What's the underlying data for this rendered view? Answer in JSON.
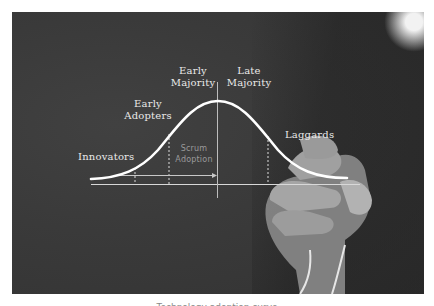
{
  "diagram": {
    "curve_type": "bell",
    "segments": [
      {
        "label": "Innovators"
      },
      {
        "label": "Early Adopters"
      },
      {
        "label": "Early Majority"
      },
      {
        "label": "Late Majority"
      },
      {
        "label": "Laggards"
      }
    ],
    "labels": {
      "innovators": "Innovators",
      "early_adopters_1": "Early",
      "early_adopters_2": "Adopters",
      "early_majority_1": "Early",
      "early_majority_2": "Majority",
      "late_majority_1": "Late",
      "late_majority_2": "Majority",
      "laggards": "Laggards",
      "scrum_1": "Scrum",
      "scrum_2": "Adoption"
    },
    "colors": {
      "background": "#3a3a3a",
      "curve": "#ffffff",
      "lines": "#d8d8d8",
      "scrum_text": "#9a9a9a"
    }
  },
  "caption": "Technology adoption curve"
}
